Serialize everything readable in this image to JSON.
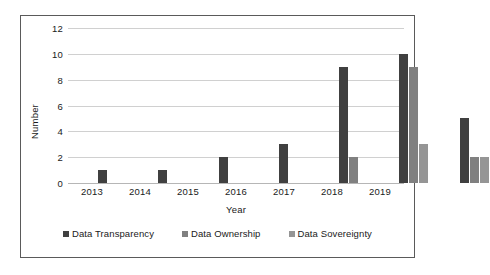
{
  "chart_data": {
    "type": "bar",
    "title": "",
    "xlabel": "Year",
    "ylabel": "Number",
    "categories": [
      "2013",
      "2014",
      "2015",
      "2016",
      "2017",
      "2018",
      "2019"
    ],
    "series": [
      {
        "name": "Data Transparency",
        "color": "#404040",
        "values": [
          1,
          1,
          2,
          3,
          9,
          10,
          5
        ]
      },
      {
        "name": "Data Ownership",
        "color": "#808080",
        "values": [
          0,
          0,
          0,
          0,
          2,
          9,
          2
        ]
      },
      {
        "name": "Data Sovereignty",
        "color": "#959595",
        "values": [
          0,
          0,
          0,
          0,
          0,
          3,
          2
        ]
      }
    ],
    "ylim": [
      0,
      12
    ],
    "yticks": [
      0,
      2,
      4,
      6,
      8,
      10,
      12
    ],
    "grid": true,
    "legend_position": "bottom",
    "orientation": "vertical"
  },
  "figure": {
    "border_color": "#5a5a5a",
    "background": "#ffffff",
    "gridline_color": "#d0d0d0"
  }
}
